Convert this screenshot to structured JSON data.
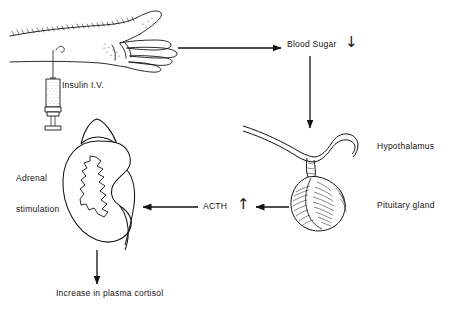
{
  "diagram": {
    "background_color": "#ffffff",
    "ink_color": "#15120f",
    "labels": {
      "blood_sugar": "Blood Sugar",
      "blood_sugar_change_glyph": "↓",
      "blood_sugar_change_meaning": "decrease",
      "hypothalamus": "Hypothalamus",
      "pituitary_gland": "Pituitary gland",
      "insulin": "Insulin I.V.",
      "adrenal_stimulation_line1": "Adrenal",
      "adrenal_stimulation_line2": "stimulation",
      "acth": "ACTH",
      "acth_change_glyph": "↑",
      "acth_change_meaning": "increase",
      "plasma_cortisol": "Increase in plasma cortisol"
    },
    "illustrations": [
      {
        "name": "arm-with-hand",
        "description": "Forearm and open hand, stippled line drawing"
      },
      {
        "name": "syringe",
        "description": "Syringe with stippled barrel injecting into forearm vein"
      },
      {
        "name": "kidney-with-adrenal-gland",
        "description": "Kidney with triangular adrenal gland cap and medulla outline"
      },
      {
        "name": "hypothalamus-pituitary",
        "description": "Hypothalamic stalk with shaded pituitary gland hanging below"
      }
    ],
    "flow_arrows": [
      {
        "name": "arm-to-blood-sugar",
        "direction": "right"
      },
      {
        "name": "blood-sugar-to-hypothalamus",
        "direction": "down"
      },
      {
        "name": "pituitary-to-acth",
        "direction": "left"
      },
      {
        "name": "acth-to-adrenal",
        "direction": "left"
      },
      {
        "name": "adrenal-to-cortisol",
        "direction": "down"
      }
    ]
  }
}
